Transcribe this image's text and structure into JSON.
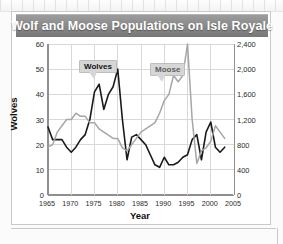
{
  "card": {
    "title": "Wolf and Moose Populations on Isle Royale"
  },
  "labels": {
    "wolves_callout": "Wolves",
    "moose_callout": "Moose",
    "y_left_title": "Wolves",
    "y_right_title": "Moose",
    "x_title": "Year"
  },
  "colors": {
    "wolves_line": "#1a1a1a",
    "moose_line": "#a6a6a6",
    "grid": "#d8d8d8",
    "axis": "#8f8f8f",
    "titlebar_top": "#9c9c9c",
    "titlebar_bottom": "#777777",
    "callout_bg": "#d6d6d6"
  },
  "chart_data": {
    "type": "line",
    "title": "Wolf and Moose Populations on Isle Royale",
    "xlabel": "Year",
    "ylabel": "Wolves",
    "y2label": "Moose",
    "xlim": [
      1965,
      2005
    ],
    "ylim": [
      0,
      60
    ],
    "y2lim": [
      0,
      2400
    ],
    "grid": true,
    "legend": "inline-callouts",
    "xticks": [
      1965,
      1970,
      1975,
      1980,
      1985,
      1990,
      1995,
      2000,
      2005
    ],
    "xtick_labels": [
      "1965",
      "1970",
      "1975",
      "1980",
      "1985",
      "1990",
      "1995",
      "2000",
      "2005"
    ],
    "yticks": [
      0,
      10,
      20,
      30,
      40,
      50,
      60
    ],
    "ytick_labels": [
      "0",
      "10",
      "20",
      "30",
      "40",
      "50",
      "60"
    ],
    "y2ticks": [
      0,
      400,
      800,
      1200,
      1600,
      2000,
      2400
    ],
    "y2tick_labels": [
      "0",
      "400",
      "800",
      "1,200",
      "1,600",
      "2,000",
      "2,400"
    ],
    "x": [
      1965,
      1966,
      1967,
      1968,
      1969,
      1970,
      1971,
      1972,
      1973,
      1974,
      1975,
      1976,
      1977,
      1978,
      1979,
      1980,
      1981,
      1982,
      1983,
      1984,
      1985,
      1986,
      1987,
      1988,
      1989,
      1990,
      1991,
      1992,
      1993,
      1994,
      1995,
      1996,
      1997,
      1998,
      1999,
      2000,
      2001,
      2002,
      2003
    ],
    "series": [
      {
        "name": "Wolves",
        "axis": "left",
        "color": "#1a1a1a",
        "unit": "wolves",
        "values": [
          27,
          22,
          22,
          22,
          19,
          17,
          19,
          22,
          24,
          30,
          41,
          44,
          34,
          40,
          43,
          50,
          30,
          14,
          23,
          24,
          22,
          20,
          16,
          12,
          11,
          15,
          12,
          12,
          13,
          15,
          16,
          22,
          24,
          14,
          25,
          29,
          19,
          17,
          19
        ]
      },
      {
        "name": "Moose",
        "axis": "right",
        "color": "#a6a6a6",
        "unit": "moose",
        "values": [
          760,
          800,
          1000,
          1100,
          1200,
          1200,
          1300,
          1250,
          1250,
          1150,
          1150,
          1050,
          1000,
          950,
          900,
          900,
          750,
          700,
          800,
          900,
          1000,
          1050,
          1100,
          1150,
          1300,
          1500,
          1600,
          1900,
          1800,
          1900,
          2400,
          1200,
          500,
          700,
          750,
          850,
          1100,
          1000,
          900
        ]
      }
    ],
    "annotations": [
      {
        "text": "Wolves",
        "series": "Wolves",
        "near_year": 1980
      },
      {
        "text": "Moose",
        "series": "Moose",
        "near_year": 1996
      }
    ]
  }
}
